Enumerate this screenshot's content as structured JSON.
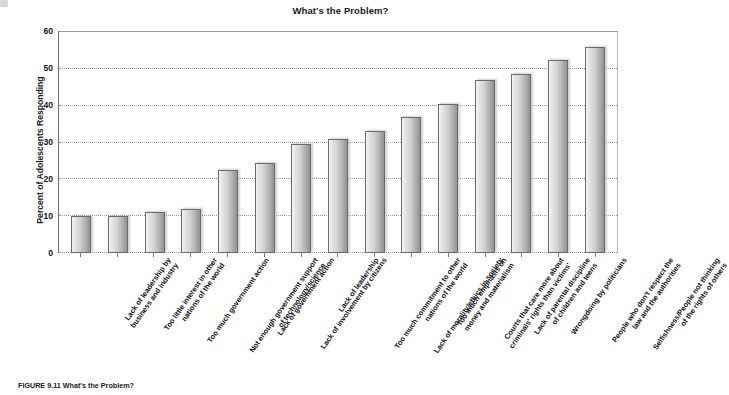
{
  "figure": {
    "caption_number": "FIGURE 9.11",
    "caption_text": "What's the Problem?"
  },
  "chart_data": {
    "type": "bar",
    "title": "What's the Problem?",
    "xlabel": "",
    "ylabel": "Percent of Adolescents Responding",
    "ylim": [
      0,
      60
    ],
    "ytick_values": [
      0,
      10,
      20,
      30,
      40,
      50,
      60
    ],
    "ytick_labels": [
      "0",
      "10",
      "20",
      "30",
      "40",
      "50",
      "60"
    ],
    "grid": true,
    "legend": "none",
    "orientation": "vertical",
    "categories": [
      "Lack of leadership by business and industry",
      "Too little interest in other nations of the world",
      "Too much government action",
      "Not enough government support of technology/science",
      "Lack of government action",
      "Lack of involvement by citizens",
      "Lack of leadership",
      "Too much commitment to other nations of the world",
      "Lack of morality/ethics in society",
      "Too much emphasis on money and materialism",
      "Courts that care more about criminals' rights than victims'",
      "Lack of parental discipline of children and teens",
      "Wrongdoing by politicians",
      "People who don't respect the law and the authorities",
      "Selfishness/People not thinking of the rights of others"
    ],
    "category_lines": [
      [
        "Lack of leadership by",
        "business and industry"
      ],
      [
        "Too little interest in other",
        "nations of the world"
      ],
      [
        "Too much government action"
      ],
      [
        "Not enough government support",
        "of technology/science"
      ],
      [
        "Lack of government action"
      ],
      [
        "Lack of involvement by citizens"
      ],
      [
        "Lack of leadership"
      ],
      [
        "Too much commitment to other",
        "nations of the world"
      ],
      [
        "Lack of morality/ethics in society"
      ],
      [
        "Too much emphasis on",
        "money and materialism"
      ],
      [
        "Courts that care more about",
        "criminals' rights than victims'"
      ],
      [
        "Lack of parental discipline",
        "of children and teens"
      ],
      [
        "Wrongdoing by politicians"
      ],
      [
        "People who don't respect the",
        "law and the authorities"
      ],
      [
        "Selfishness/People not thinking",
        "of the rights of others"
      ]
    ],
    "values": [
      10,
      10,
      11,
      12,
      22.5,
      24.5,
      29.5,
      31,
      33,
      37,
      40.5,
      47,
      48.5,
      52.5,
      56
    ]
  },
  "colors": {
    "bar_fill_light": "#f2f2f2",
    "bar_fill_dark": "#949494",
    "bar_border": "#6b6b6b",
    "grid": "#9b9b9b",
    "axis": "#6d6d6d",
    "text": "#161616",
    "background": "#ffffff"
  }
}
